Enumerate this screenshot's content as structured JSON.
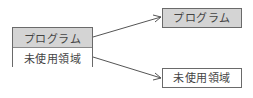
{
  "diagram": {
    "source_stack": {
      "cells": [
        {
          "label": "プログラム",
          "fill": "#d4d4d4"
        },
        {
          "label": "未使用領域",
          "fill": "#ffffff"
        }
      ]
    },
    "targets": [
      {
        "label": "プログラム",
        "fill": "#d4d4d4"
      },
      {
        "label": "未使用領域",
        "fill": "#ffffff"
      }
    ],
    "arrows": [
      {
        "from": "source_stack.cells.0",
        "to": "targets.0"
      },
      {
        "from": "source_stack.cells.1",
        "to": "targets.1"
      }
    ],
    "colors": {
      "border": "#6a6a6a",
      "shaded_fill": "#d4d4d4",
      "text": "#444444",
      "arrow": "#555555"
    }
  }
}
